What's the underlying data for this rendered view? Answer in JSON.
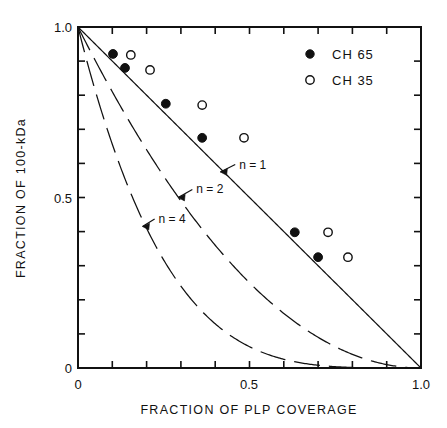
{
  "chart_data": {
    "type": "scatter",
    "title": "",
    "xlabel": "FRACTION OF PLP COVERAGE",
    "ylabel": "FRACTION OF 100-kDa",
    "xlim": [
      0,
      1.0
    ],
    "ylim": [
      0,
      1.0
    ],
    "grid": false,
    "x_ticklabels": [
      "0",
      "0.5",
      "1.0"
    ],
    "x_ticklabel_values": [
      0,
      0.5,
      1.0
    ],
    "y_ticklabels": [
      "0",
      "0.5",
      "1.0"
    ],
    "y_ticklabel_values": [
      0,
      0.5,
      1.0
    ],
    "minor_tick_interval": 0.1,
    "legend_position": "top-right",
    "series": [
      {
        "name": "CH 65",
        "marker": "filled-circle",
        "points": [
          {
            "x": 0.102,
            "y": 0.921
          },
          {
            "x": 0.137,
            "y": 0.88
          },
          {
            "x": 0.256,
            "y": 0.775
          },
          {
            "x": 0.362,
            "y": 0.675
          },
          {
            "x": 0.632,
            "y": 0.398
          },
          {
            "x": 0.7,
            "y": 0.325
          }
        ]
      },
      {
        "name": "CH 35",
        "marker": "open-circle",
        "points": [
          {
            "x": 0.154,
            "y": 0.918
          },
          {
            "x": 0.21,
            "y": 0.874
          },
          {
            "x": 0.362,
            "y": 0.771
          },
          {
            "x": 0.484,
            "y": 0.675
          },
          {
            "x": 0.729,
            "y": 0.398
          },
          {
            "x": 0.787,
            "y": 0.325
          }
        ]
      }
    ],
    "curves": [
      {
        "label": "n = 1",
        "n": 1,
        "style": "solid",
        "equation": "y = (1 - x)^1",
        "label_x": 0.47,
        "label_y": 0.585,
        "arrow_to_x": 0.415,
        "arrow_to_y": 0.575
      },
      {
        "label": "n = 2",
        "n": 2,
        "style": "dashed",
        "equation": "y = (1 - x)^2",
        "label_x": 0.345,
        "label_y": 0.512,
        "arrow_to_x": 0.292,
        "arrow_to_y": 0.5
      },
      {
        "label": "n = 4",
        "n": 4,
        "style": "dashed",
        "equation": "y = (1 - x)^4",
        "label_x": 0.235,
        "label_y": 0.425,
        "arrow_to_x": 0.188,
        "arrow_to_y": 0.415
      }
    ],
    "legend": [
      {
        "label": "CH 65",
        "marker": "filled-circle"
      },
      {
        "label": "CH 35",
        "marker": "open-circle"
      }
    ]
  },
  "colors": {
    "ink": "#111111",
    "background": "#ffffff"
  }
}
